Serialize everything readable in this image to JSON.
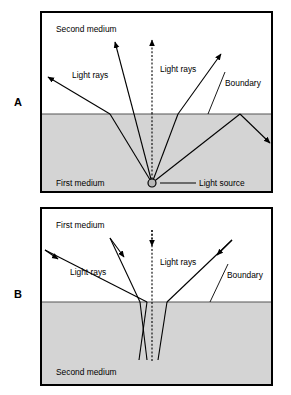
{
  "figure": {
    "background_color": "#ffffff",
    "medium_fill_color": "#d4d4d4",
    "line_color": "#000000",
    "frame_color": "#000000"
  },
  "panels": [
    {
      "letter": "A",
      "frame": {
        "x": 41,
        "y": 12,
        "width": 231,
        "height": 180
      },
      "boundary_y": 114,
      "upper_region_label": "Second medium",
      "lower_region_label": "First medium",
      "upper_region_shaded": false,
      "lower_region_shaded": true,
      "labels": {
        "light_rays_left": "Light rays",
        "light_rays_right": "Light rays",
        "boundary": "Boundary",
        "light_source": "Light source"
      },
      "source": {
        "x": 152,
        "y": 183,
        "radius": 4
      },
      "description": "Rays from a point source in the denser first medium refract away from the normal crossing into the second medium; the steepest ray is totally internally reflected at the boundary."
    },
    {
      "letter": "B",
      "frame": {
        "x": 41,
        "y": 208,
        "width": 231,
        "height": 177
      },
      "boundary_y": 302,
      "upper_region_label": "First medium",
      "lower_region_label": "Second medium",
      "upper_region_shaded": false,
      "lower_region_shaded": true,
      "labels": {
        "light_rays_left": "Light rays",
        "light_rays_right": "Light rays",
        "boundary": "Boundary"
      },
      "description": "Rays entering from the first medium refract toward the normal on crossing into the denser second medium and converge."
    }
  ],
  "panel_a_rays": [
    {
      "name": "ray-far-left",
      "incident": [
        [
          152,
          183
        ],
        [
          110,
          114
        ]
      ],
      "refracted": [
        [
          110,
          114
        ],
        [
          46,
          76
        ]
      ],
      "arrow": "outgoing"
    },
    {
      "name": "ray-left",
      "incident": [
        [
          152,
          183
        ],
        [
          134,
          114
        ]
      ],
      "refracted": [
        [
          134,
          114
        ],
        [
          114,
          40
        ]
      ],
      "arrow": "outgoing"
    },
    {
      "name": "ray-normal",
      "incident": [
        [
          152,
          183
        ],
        [
          152,
          114
        ]
      ],
      "refracted": [
        [
          152,
          114
        ],
        [
          152,
          38
        ]
      ],
      "arrow": "outgoing",
      "dotted": true
    },
    {
      "name": "ray-right",
      "incident": [
        [
          152,
          183
        ],
        [
          178,
          114
        ]
      ],
      "refracted": [
        [
          178,
          114
        ],
        [
          223,
          52
        ]
      ],
      "arrow": "outgoing"
    },
    {
      "name": "ray-reflected",
      "incident": [
        [
          152,
          183
        ],
        [
          240,
          114
        ]
      ],
      "refracted": [
        [
          240,
          114
        ],
        [
          272,
          145
        ]
      ],
      "arrow": "reflected"
    }
  ],
  "panel_b_rays": [
    {
      "name": "ray-far-left",
      "incident": [
        [
          44,
          250
        ],
        [
          147,
          302
        ]
      ],
      "refracted": [
        [
          147,
          302
        ],
        [
          140,
          360
        ]
      ],
      "arrow": "incoming"
    },
    {
      "name": "ray-left",
      "incident": [
        [
          110,
          240
        ],
        [
          140,
          302
        ]
      ],
      "refracted": [
        [
          140,
          302
        ],
        [
          148,
          360
        ]
      ],
      "arrow": "incoming"
    },
    {
      "name": "ray-normal",
      "incident": [
        [
          152,
          232
        ],
        [
          152,
          302
        ]
      ],
      "refracted": [
        [
          152,
          302
        ],
        [
          152,
          362
        ]
      ],
      "arrow": "incoming",
      "dotted": true
    },
    {
      "name": "ray-right",
      "incident": [
        [
          230,
          240
        ],
        [
          167,
          302
        ]
      ],
      "refracted": [
        [
          167,
          302
        ],
        [
          157,
          360
        ]
      ],
      "arrow": "incoming"
    }
  ]
}
